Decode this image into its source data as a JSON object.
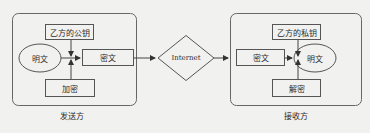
{
  "diagram": {
    "sender": {
      "title": "发送方",
      "key_label": "乙方的公钥",
      "plaintext_label": "明文",
      "ciphertext_label": "密文",
      "operation_label": "加密"
    },
    "network": {
      "label": "Internet"
    },
    "receiver": {
      "title": "接收方",
      "key_label": "乙方的私钥",
      "ciphertext_label": "密文",
      "plaintext_label": "明文",
      "operation_label": "解密"
    }
  },
  "colors": {
    "background": "#f1f1ef",
    "stroke": "#555555",
    "text": "#2b2b2b"
  }
}
